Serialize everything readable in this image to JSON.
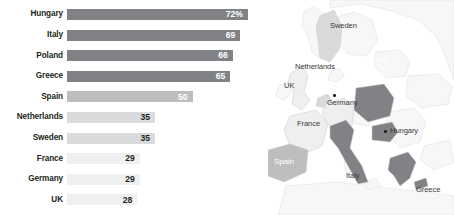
{
  "chart_data": {
    "type": "bar",
    "orientation": "horizontal",
    "title": "",
    "xlabel": "",
    "ylabel": "",
    "xlim": [
      0,
      80
    ],
    "grid": false,
    "legend": false,
    "categories": [
      "Hungary",
      "Italy",
      "Poland",
      "Greece",
      "Spain",
      "Netherlands",
      "Sweden",
      "France",
      "Germany",
      "UK"
    ],
    "values": [
      72,
      69,
      66,
      65,
      50,
      35,
      35,
      29,
      29,
      28
    ],
    "value_labels": [
      "72%",
      "69",
      "66",
      "65",
      "50",
      "35",
      "35",
      "29",
      "29",
      "28"
    ],
    "bars": [
      {
        "category": "Hungary",
        "value": 72,
        "label": "72%",
        "bar_color": "#808285",
        "label_color": "#ffffff"
      },
      {
        "category": "Italy",
        "value": 69,
        "label": "69",
        "bar_color": "#808285",
        "label_color": "#ffffff"
      },
      {
        "category": "Poland",
        "value": 66,
        "label": "66",
        "bar_color": "#808285",
        "label_color": "#ffffff"
      },
      {
        "category": "Greece",
        "value": 65,
        "label": "65",
        "bar_color": "#808285",
        "label_color": "#ffffff"
      },
      {
        "category": "Spain",
        "value": 50,
        "label": "50",
        "bar_color": "#bcbec0",
        "label_color": "#ffffff"
      },
      {
        "category": "Netherlands",
        "value": 35,
        "label": "35",
        "bar_color": "#d9dadb",
        "label_color": "#231f20"
      },
      {
        "category": "Sweden",
        "value": 35,
        "label": "35",
        "bar_color": "#d9dadb",
        "label_color": "#231f20"
      },
      {
        "category": "France",
        "value": 29,
        "label": "29",
        "bar_color": "#efeff0",
        "label_color": "#231f20"
      },
      {
        "category": "Germany",
        "value": 29,
        "label": "29",
        "bar_color": "#efeff0",
        "label_color": "#231f20"
      },
      {
        "category": "UK",
        "value": 28,
        "label": "28",
        "bar_color": "#efeff0",
        "label_color": "#231f20"
      }
    ]
  },
  "map": {
    "type": "choropleth",
    "region": "Europe",
    "labels": [
      {
        "name": "Sweden",
        "text": "Sweden",
        "style": "dark-text"
      },
      {
        "name": "Netherlands",
        "text": "Netherlands",
        "style": "dark-text"
      },
      {
        "name": "UK",
        "text": "UK",
        "style": "dark-text"
      },
      {
        "name": "Poland",
        "text": "Poland",
        "style": "light-text"
      },
      {
        "name": "Germany",
        "text": "Germany",
        "style": "dark-text"
      },
      {
        "name": "France",
        "text": "France",
        "style": "dark-text"
      },
      {
        "name": "Hungary",
        "text": "Hungary",
        "style": "dark-text"
      },
      {
        "name": "Spain",
        "text": "Spain",
        "style": "light-text"
      },
      {
        "name": "Italy",
        "text": "Italy",
        "style": "dark-text"
      },
      {
        "name": "Greece",
        "text": "Greece",
        "style": "dark-text"
      }
    ],
    "colors": {
      "high": "#808285",
      "medium": "#bcbec0",
      "low": "#d9dadb",
      "lowest": "#efeff0",
      "other_land": "#f7f7f7",
      "water": "#ffffff",
      "border": "#d0d0d0"
    }
  }
}
